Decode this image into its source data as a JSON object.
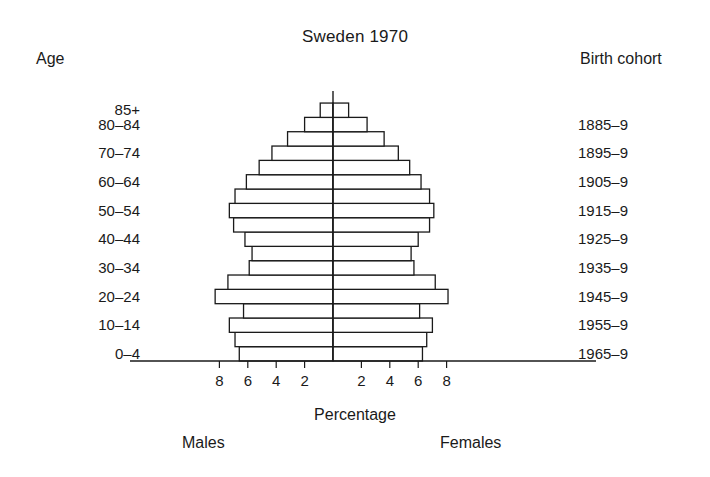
{
  "chart_data": {
    "type": "bar",
    "subtype": "population-pyramid",
    "title": "Sweden 1970",
    "xlabel": "Percentage",
    "ylabel": "Age",
    "right_axis_label": "Birth cohort",
    "left_series_name": "Males",
    "right_series_name": "Females",
    "grid": false,
    "legend_position": "below-axis",
    "xlim": [
      -9,
      9
    ],
    "xticks_left": [
      "8",
      "6",
      "4",
      "2"
    ],
    "xticks_right": [
      "2",
      "4",
      "6",
      "8"
    ],
    "xtick_values_left": [
      8,
      6,
      4,
      2
    ],
    "xtick_values_right": [
      2,
      4,
      6,
      8
    ],
    "categories": [
      "0–4",
      "5–9",
      "10–14",
      "15–19",
      "20–24",
      "25–29",
      "30–34",
      "35–39",
      "40–44",
      "45–49",
      "50–54",
      "55–59",
      "60–64",
      "65–69",
      "70–74",
      "75–79",
      "80–84",
      "85+"
    ],
    "birth_cohorts": [
      "1965–9",
      "1960–4",
      "1955–9",
      "1950–4",
      "1945–9",
      "1940–4",
      "1935–9",
      "1930–4",
      "1925–9",
      "1920–4",
      "1915–9",
      "1910–4",
      "1905–9",
      "1900–4",
      "1895–9",
      "1890–4",
      "1885–9",
      "1880 and earlier"
    ],
    "series": [
      {
        "name": "Males",
        "side": "left",
        "values": [
          6.6,
          6.9,
          7.3,
          6.3,
          8.3,
          7.4,
          5.9,
          5.7,
          6.2,
          7.0,
          7.3,
          6.9,
          6.1,
          5.2,
          4.3,
          3.2,
          2.0,
          0.9
        ]
      },
      {
        "name": "Females",
        "side": "right",
        "values": [
          6.3,
          6.6,
          7.0,
          6.1,
          8.1,
          7.2,
          5.7,
          5.5,
          6.0,
          6.8,
          7.1,
          6.8,
          6.2,
          5.4,
          4.6,
          3.6,
          2.4,
          1.1
        ]
      }
    ],
    "visible_age_labels": [
      {
        "category": "85+",
        "label": "85+"
      },
      {
        "category": "80–84",
        "label": "80–84"
      },
      {
        "category": "70–74",
        "label": "70–74"
      },
      {
        "category": "60–64",
        "label": "60–64"
      },
      {
        "category": "50–54",
        "label": "50–54"
      },
      {
        "category": "40–44",
        "label": "40–44"
      },
      {
        "category": "30–34",
        "label": "30–34"
      },
      {
        "category": "20–24",
        "label": "20–24"
      },
      {
        "category": "10–14",
        "label": "10–14"
      },
      {
        "category": "0–4",
        "label": "0–4"
      }
    ],
    "visible_cohort_labels": [
      "1885–9",
      "1895–9",
      "1905–9",
      "1915–9",
      "1925–9",
      "1935–9",
      "1945–9",
      "1955–9",
      "1965–9"
    ],
    "colors": {
      "bar_fill": "#ffffff",
      "bar_stroke": "#1a1a1a",
      "axis": "#1a1a1a",
      "text": "#1a1a1a",
      "background": "#ffffff"
    }
  },
  "header": {
    "title": "Sweden 1970",
    "age_axis_title": "Age",
    "cohort_axis_title": "Birth cohort"
  },
  "footer": {
    "x_axis_title": "Percentage",
    "males_label": "Males",
    "females_label": "Females"
  }
}
